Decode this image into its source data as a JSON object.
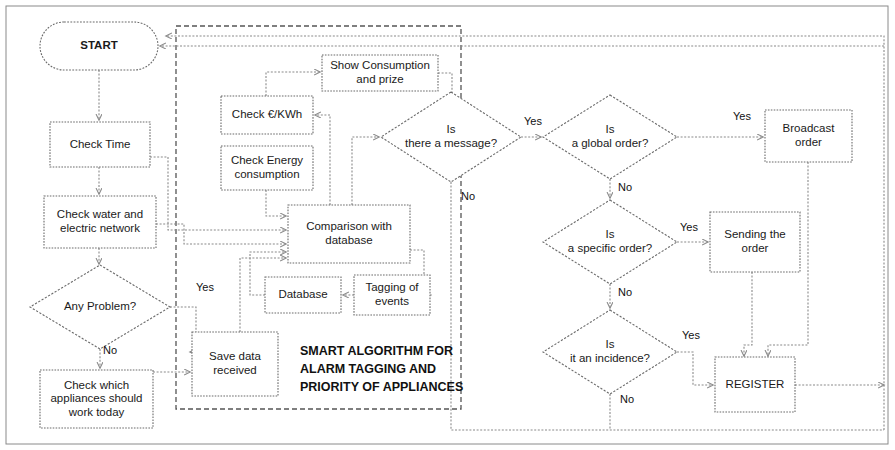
{
  "diagram": {
    "type": "flowchart",
    "title_block": {
      "lines": [
        "SMART ALGORITHM FOR",
        "ALARM TAGGING AND",
        "PRIORITY OF APPLIANCES"
      ],
      "x": 300,
      "y": 352
    },
    "colors": {
      "background": "#ffffff",
      "shape_stroke": "#6a6a6a",
      "link_stroke": "#8a8a8a",
      "text": "#1a1a1a",
      "group_stroke": "#555555"
    },
    "nodes": [
      {
        "id": "start",
        "shape": "terminal",
        "lines": [
          "START"
        ],
        "x": 40,
        "y": 22,
        "w": 118,
        "h": 48,
        "bold": true
      },
      {
        "id": "check_time",
        "shape": "box",
        "lines": [
          "Check Time"
        ],
        "x": 50,
        "y": 122,
        "w": 100,
        "h": 45
      },
      {
        "id": "check_water",
        "shape": "box",
        "lines": [
          "Check water and",
          "electric network"
        ],
        "x": 44,
        "y": 196,
        "w": 112,
        "h": 52
      },
      {
        "id": "any_problem",
        "shape": "diamond",
        "lines": [
          "Any Problem?"
        ],
        "x": 30,
        "y": 265,
        "w": 140,
        "h": 84
      },
      {
        "id": "check_which",
        "shape": "box",
        "lines": [
          "Check which",
          "appliances should",
          "work today"
        ],
        "x": 40,
        "y": 370,
        "w": 113,
        "h": 58
      },
      {
        "id": "save_data",
        "shape": "box",
        "lines": [
          "Save data",
          "received"
        ],
        "x": 192,
        "y": 332,
        "w": 86,
        "h": 64
      },
      {
        "id": "check_kwh",
        "shape": "box",
        "lines": [
          "Check €/KWh"
        ],
        "x": 221,
        "y": 96,
        "w": 92,
        "h": 38
      },
      {
        "id": "check_energy",
        "shape": "box",
        "lines": [
          "Check Energy",
          "consumption"
        ],
        "x": 221,
        "y": 146,
        "w": 92,
        "h": 44
      },
      {
        "id": "show_consumption",
        "shape": "box",
        "lines": [
          "Show Consumption",
          "and prize"
        ],
        "x": 322,
        "y": 55,
        "w": 116,
        "h": 36
      },
      {
        "id": "comparison",
        "shape": "box",
        "lines": [
          "Comparison with",
          "database"
        ],
        "x": 288,
        "y": 205,
        "w": 122,
        "h": 58
      },
      {
        "id": "database",
        "shape": "box",
        "lines": [
          "Database"
        ],
        "x": 265,
        "y": 277,
        "w": 76,
        "h": 36
      },
      {
        "id": "tagging",
        "shape": "box",
        "lines": [
          "Tagging of",
          "events"
        ],
        "x": 354,
        "y": 275,
        "w": 76,
        "h": 40
      },
      {
        "id": "is_message",
        "shape": "diamond",
        "lines": [
          "Is",
          "there a message?"
        ],
        "x": 381,
        "y": 92,
        "w": 140,
        "h": 90
      },
      {
        "id": "is_global",
        "shape": "diamond",
        "lines": [
          "Is",
          "a global order?"
        ],
        "x": 543,
        "y": 95,
        "w": 134,
        "h": 84
      },
      {
        "id": "is_specific",
        "shape": "diamond",
        "lines": [
          "Is",
          "a specific order?"
        ],
        "x": 543,
        "y": 200,
        "w": 134,
        "h": 84
      },
      {
        "id": "is_incidence",
        "shape": "diamond",
        "lines": [
          "Is",
          "it an incidence?"
        ],
        "x": 543,
        "y": 310,
        "w": 134,
        "h": 84
      },
      {
        "id": "broadcast",
        "shape": "box",
        "lines": [
          "Broadcast",
          "order"
        ],
        "x": 765,
        "y": 110,
        "w": 87,
        "h": 52
      },
      {
        "id": "sending",
        "shape": "box",
        "lines": [
          "Sending the",
          "order"
        ],
        "x": 710,
        "y": 212,
        "w": 90,
        "h": 60
      },
      {
        "id": "register",
        "shape": "box",
        "lines": [
          "REGISTER"
        ],
        "x": 715,
        "y": 357,
        "w": 80,
        "h": 55
      }
    ],
    "edge_labels": [
      {
        "id": "lbl-any-problem-yes",
        "text": "Yes",
        "x": 205,
        "y": 288
      },
      {
        "id": "lbl-any-problem-no",
        "text": "No",
        "x": 110,
        "y": 351
      },
      {
        "id": "lbl-message-yes",
        "text": "Yes",
        "x": 533,
        "y": 122
      },
      {
        "id": "lbl-message-no",
        "text": "No",
        "x": 468,
        "y": 197
      },
      {
        "id": "lbl-global-yes",
        "text": "Yes",
        "x": 742,
        "y": 117
      },
      {
        "id": "lbl-global-no",
        "text": "No",
        "x": 625,
        "y": 188
      },
      {
        "id": "lbl-specific-yes",
        "text": "Yes",
        "x": 689,
        "y": 228
      },
      {
        "id": "lbl-specific-no",
        "text": "No",
        "x": 625,
        "y": 293
      },
      {
        "id": "lbl-incidence-yes",
        "text": "Yes",
        "x": 691,
        "y": 336
      },
      {
        "id": "lbl-incidence-no",
        "text": "No",
        "x": 627,
        "y": 400
      }
    ]
  }
}
